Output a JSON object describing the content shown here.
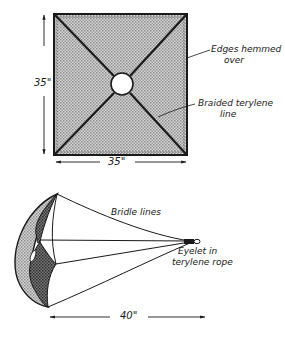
{
  "diagram": {
    "type": "technical-illustration",
    "top_view": {
      "width_label": "35\"",
      "height_label": "35\"",
      "callouts": [
        {
          "id": "edges",
          "line1": "Edges hemmed",
          "line2": "over"
        },
        {
          "id": "line",
          "line1": "Braided terylene",
          "line2": "line"
        }
      ]
    },
    "side_view": {
      "length_label": "40\"",
      "callouts": [
        {
          "id": "bridle",
          "line1": "Bridle lines"
        },
        {
          "id": "eyelet",
          "line1": "Eyelet in",
          "line2": "terylene rope"
        }
      ]
    },
    "colors": {
      "ink": "#1a1a1a",
      "fabric": "#bdbdbd",
      "fabric_dark": "#6e6e6e",
      "background": "#ffffff"
    }
  }
}
